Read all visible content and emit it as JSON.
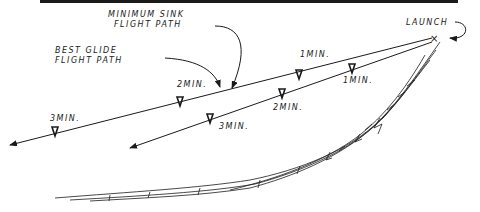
{
  "diagram": {
    "labels": {
      "min_sink_line1": "MINIMUM SINK",
      "min_sink_line2": "FLIGHT PATH",
      "best_glide_line1": "BEST GLIDE",
      "best_glide_line2": "FLIGHT PATH",
      "launch": "LAUNCH",
      "best_1min": "1MIN.",
      "best_2min": "2MIN.",
      "best_3min": "3MIN.",
      "sink_1min": "1MIN.",
      "sink_2min": "2MIN.",
      "sink_3min": "3MIN."
    },
    "colors": {
      "ink": "#1a1a1a",
      "background": "#ffffff"
    }
  }
}
